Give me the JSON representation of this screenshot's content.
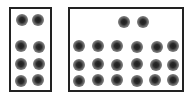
{
  "boxes": [
    {
      "id": "left-group",
      "rect": {
        "x": 9,
        "y": 7,
        "w": 43,
        "h": 85
      },
      "dots": [
        {
          "x": 22,
          "y": 20
        },
        {
          "x": 38,
          "y": 20
        },
        {
          "x": 21,
          "y": 46
        },
        {
          "x": 39,
          "y": 47
        },
        {
          "x": 21,
          "y": 64
        },
        {
          "x": 39,
          "y": 64
        },
        {
          "x": 21,
          "y": 81
        },
        {
          "x": 38,
          "y": 80
        }
      ]
    },
    {
      "id": "right-group",
      "rect": {
        "x": 68,
        "y": 7,
        "w": 116,
        "h": 85
      },
      "dots": [
        {
          "x": 124,
          "y": 22
        },
        {
          "x": 143,
          "y": 22
        },
        {
          "x": 79,
          "y": 46
        },
        {
          "x": 98,
          "y": 46
        },
        {
          "x": 117,
          "y": 46
        },
        {
          "x": 137,
          "y": 47
        },
        {
          "x": 157,
          "y": 47
        },
        {
          "x": 173,
          "y": 46
        },
        {
          "x": 79,
          "y": 65
        },
        {
          "x": 98,
          "y": 64
        },
        {
          "x": 117,
          "y": 65
        },
        {
          "x": 137,
          "y": 64
        },
        {
          "x": 156,
          "y": 65
        },
        {
          "x": 173,
          "y": 65
        },
        {
          "x": 79,
          "y": 81
        },
        {
          "x": 98,
          "y": 80
        },
        {
          "x": 117,
          "y": 80
        },
        {
          "x": 137,
          "y": 81
        },
        {
          "x": 155,
          "y": 80
        },
        {
          "x": 173,
          "y": 80
        }
      ]
    }
  ],
  "counts": {
    "left": 8,
    "right": 20
  }
}
